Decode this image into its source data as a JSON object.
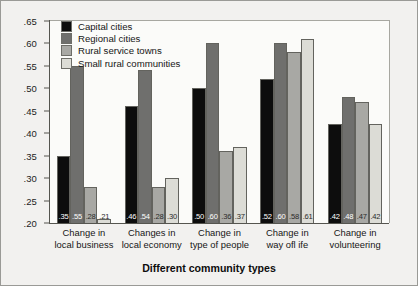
{
  "chart_data": {
    "type": "bar",
    "title": "",
    "xlabel": "Different community types",
    "ylabel": "",
    "ylim": [
      0.2,
      0.65
    ],
    "ytick_labels": [
      ".20",
      ".25",
      ".30",
      ".35",
      ".40",
      ".45",
      ".50",
      ".55",
      ".60",
      ".65"
    ],
    "ytick_values": [
      0.2,
      0.25,
      0.3,
      0.35,
      0.4,
      0.45,
      0.5,
      0.55,
      0.6,
      0.65
    ],
    "grid": false,
    "legend_position": "upper-left-inside",
    "categories": [
      "Change in\nlocal business",
      "Changes in\nlocal economy",
      "Change in\ntype of people",
      "Change in\nway ofl ife",
      "Change in\nvolunteering"
    ],
    "category_lines": [
      [
        "Change in",
        "local business"
      ],
      [
        "Changes in",
        "local economy"
      ],
      [
        "Change in",
        "type of people"
      ],
      [
        "Change in",
        "way ofl ife"
      ],
      [
        "Change in",
        "volunteering"
      ]
    ],
    "series": [
      {
        "name": "Capital cities",
        "color": "#0d0d0d",
        "label_color": "#ffffff",
        "values": [
          0.35,
          0.46,
          0.5,
          0.52,
          0.42
        ],
        "labels": [
          ".35",
          ".46",
          ".50",
          ".52",
          ".42"
        ]
      },
      {
        "name": "Regional cities",
        "color": "#6f6f6d",
        "label_color": "#ffffff",
        "values": [
          0.55,
          0.54,
          0.6,
          0.6,
          0.48
        ],
        "labels": [
          ".55",
          ".54",
          ".60",
          ".60",
          ".48"
        ]
      },
      {
        "name": "Rural service towns",
        "color": "#a8a8a4",
        "label_color": "#2b2b2b",
        "values": [
          0.28,
          0.28,
          0.36,
          0.58,
          0.47
        ],
        "labels": [
          ".28",
          ".28",
          ".36",
          ".58",
          ".47"
        ]
      },
      {
        "name": "Small rural communities",
        "color": "#dcdcd6",
        "label_color": "#2b2b2b",
        "values": [
          0.21,
          0.3,
          0.37,
          0.61,
          0.42
        ],
        "labels": [
          ".21",
          ".30",
          ".37",
          ".61",
          ".42"
        ]
      }
    ]
  },
  "legend": {
    "items": [
      {
        "label": "Capital cities",
        "color": "#0d0d0d"
      },
      {
        "label": "Regional cities",
        "color": "#6f6f6d"
      },
      {
        "label": "Rural service towns",
        "color": "#a8a8a4"
      },
      {
        "label": "Small rural communities",
        "color": "#dcdcd6"
      }
    ]
  },
  "axis": {
    "x_title": "Different community types"
  }
}
